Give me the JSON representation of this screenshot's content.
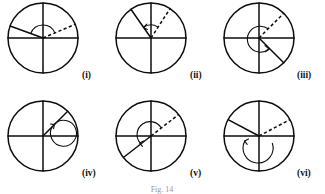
{
  "figure": {
    "caption": "Fig. 14",
    "background_color": "#ffffff",
    "ink_color": "#0d0d0d",
    "layout": {
      "columns": 3,
      "rows": 2,
      "cell_width": 108,
      "cell_height": 92
    },
    "panels": [
      {
        "id": "panel-i",
        "label": "(i)",
        "center": {
          "x": 43,
          "y": 38
        },
        "radius": 35,
        "label_pos": {
          "x": 82,
          "y": 78
        },
        "arms": [
          {
            "name": "solid-ray-upper-left",
            "style": "solid",
            "angle_deg": 160,
            "length": 35
          },
          {
            "name": "dashed-ray-upper-right",
            "style": "dashed",
            "angle_deg": 23,
            "length": 35
          }
        ],
        "arc": {
          "radius": 13,
          "start_deg": 23,
          "end_deg": 160,
          "sweep": "ccw",
          "arrow_at": "none"
        }
      },
      {
        "id": "panel-ii",
        "label": "(ii)",
        "center": {
          "x": 151,
          "y": 38
        },
        "radius": 35,
        "label_pos": {
          "x": 190,
          "y": 78
        },
        "arms": [
          {
            "name": "solid-ray-upper-left",
            "style": "solid",
            "angle_deg": 125,
            "length": 35
          },
          {
            "name": "dashed-ray-upper-right",
            "style": "dashed",
            "angle_deg": 57,
            "length": 35
          }
        ],
        "arc": {
          "radius": 13,
          "start_deg": 57,
          "end_deg": 125,
          "sweep": "ccw",
          "arrow_at": "end"
        }
      },
      {
        "id": "panel-iii",
        "label": "(iii)",
        "center": {
          "x": 259,
          "y": 38
        },
        "radius": 35,
        "label_pos": {
          "x": 299,
          "y": 78
        },
        "arms": [
          {
            "name": "dashed-ray-upper-right",
            "style": "dashed",
            "angle_deg": 45,
            "length": 35
          },
          {
            "name": "solid-ray-lower-right",
            "style": "solid",
            "angle_deg": -45,
            "length": 35
          }
        ],
        "arc": {
          "radius": 13,
          "start_deg": 45,
          "end_deg": -40,
          "sweep": "ccw-reflex",
          "arrow_at": "end"
        }
      },
      {
        "id": "panel-iv",
        "label": "(iv)",
        "center": {
          "x": 43,
          "y": 136
        },
        "radius": 35,
        "label_pos": {
          "x": 82,
          "y": 176
        },
        "arms": [
          {
            "name": "solid-ray-upper-right",
            "style": "solid",
            "angle_deg": 45,
            "length": 35
          }
        ],
        "arc": {
          "radius": 13,
          "start_deg": 45,
          "end_deg": 52,
          "sweep": "ccw-reflex",
          "arrow_at": "end"
        }
      },
      {
        "id": "panel-v",
        "label": "(v)",
        "center": {
          "x": 151,
          "y": 136
        },
        "radius": 35,
        "label_pos": {
          "x": 190,
          "y": 176
        },
        "arms": [
          {
            "name": "dashed-ray-upper-right",
            "style": "dashed",
            "angle_deg": 38,
            "length": 35
          },
          {
            "name": "solid-ray-lower-left",
            "style": "solid",
            "angle_deg": -142,
            "length": 35
          }
        ],
        "arc": {
          "radius": 13,
          "start_deg": 38,
          "end_deg": -148,
          "sweep": "ccw-reflex",
          "arrow_at": "end"
        }
      },
      {
        "id": "panel-vi",
        "label": "(vi)",
        "center": {
          "x": 259,
          "y": 136
        },
        "radius": 35,
        "label_pos": {
          "x": 299,
          "y": 176
        },
        "arms": [
          {
            "name": "solid-ray-upper-left",
            "style": "solid",
            "angle_deg": 152,
            "length": 35
          },
          {
            "name": "dashed-ray-upper-right",
            "style": "dashed",
            "angle_deg": 28,
            "length": 35
          }
        ],
        "arc": {
          "radius": 15,
          "start_deg": 28,
          "end_deg": 160,
          "sweep": "cw-reflex",
          "arrow_at": "end"
        }
      }
    ]
  }
}
